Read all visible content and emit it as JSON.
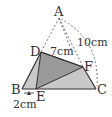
{
  "diagram": {
    "type": "geometry-triangle-fold",
    "points": {
      "A": {
        "label": "A",
        "x": 59,
        "y": 18
      },
      "B": {
        "label": "B",
        "x": 22,
        "y": 89
      },
      "C": {
        "label": "C",
        "x": 96,
        "y": 89
      },
      "D": {
        "label": "D",
        "x": 41,
        "y": 52
      },
      "E": {
        "label": "E",
        "x": 36,
        "y": 89
      },
      "F": {
        "label": "F",
        "x": 83,
        "y": 67
      }
    },
    "measurements": {
      "DF": "7cm",
      "AC": "10cm",
      "BE": "2cm"
    },
    "colors": {
      "light_fill": "#c8c8c8",
      "dark_fill": "#9a9a9a",
      "stroke": "#333333"
    }
  }
}
